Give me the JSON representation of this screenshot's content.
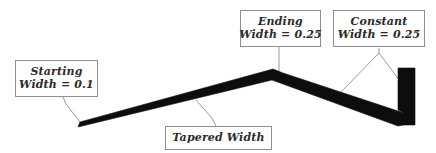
{
  "figure": {
    "type": "technical-illustration",
    "background_color": "#ffffff",
    "shape_color": "#0d0d0d",
    "leader_line_color": "#9a9a9e",
    "callout_border_color": "#8f8f93",
    "callout_fill_color": "#fefefe",
    "text_color": "#2b2b2b"
  },
  "callouts": [
    {
      "id": "starting",
      "name": "starting-width-callout",
      "line1": "Starting",
      "line2": "Width = 0.1",
      "value": 0.1,
      "property": "Starting Width"
    },
    {
      "id": "ending",
      "name": "ending-width-callout",
      "line1": "Ending",
      "line2": "Width = 0.25",
      "value": 0.25,
      "property": "Ending Width"
    },
    {
      "id": "constant",
      "name": "constant-width-callout",
      "line1": "Constant",
      "line2": "Width = 0.25",
      "value": 0.25,
      "property": "Constant Width"
    },
    {
      "id": "tapered",
      "name": "tapered-width-callout",
      "line1": "Tapered Width",
      "line2": "",
      "property": "Tapered Width"
    }
  ],
  "geometry": {
    "description": "A black polyline whose first segment tapers from a narrow start to a wider vertex, then a constant-width segment descending to the right, ending in a vertical constant-width bar.",
    "segments": [
      {
        "name": "tapered-segment",
        "start_point": [
          78,
          125
        ],
        "end_point": [
          272,
          73
        ],
        "start_width": 0.1,
        "end_width": 0.25,
        "taper": true
      },
      {
        "name": "constant-segment",
        "start_point": [
          272,
          73
        ],
        "end_point": [
          401,
          117
        ],
        "start_width": 0.25,
        "end_width": 0.25,
        "taper": false
      },
      {
        "name": "vertical-segment",
        "start_point": [
          408,
          117
        ],
        "end_point": [
          408,
          68
        ],
        "start_width": 0.25,
        "end_width": 0.25,
        "taper": false
      }
    ]
  }
}
